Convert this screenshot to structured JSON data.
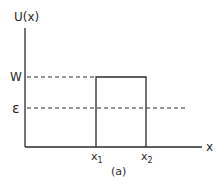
{
  "diagram": {
    "y_axis_label": "U(x)",
    "x_axis_label": "x",
    "level_high_label": "W",
    "level_energy_label": "ε",
    "x_tick_1": "x",
    "x_tick_1_sub": "1",
    "x_tick_2": "x",
    "x_tick_2_sub": "2",
    "caption": "(a)",
    "line_color": "#2a2a2a"
  }
}
